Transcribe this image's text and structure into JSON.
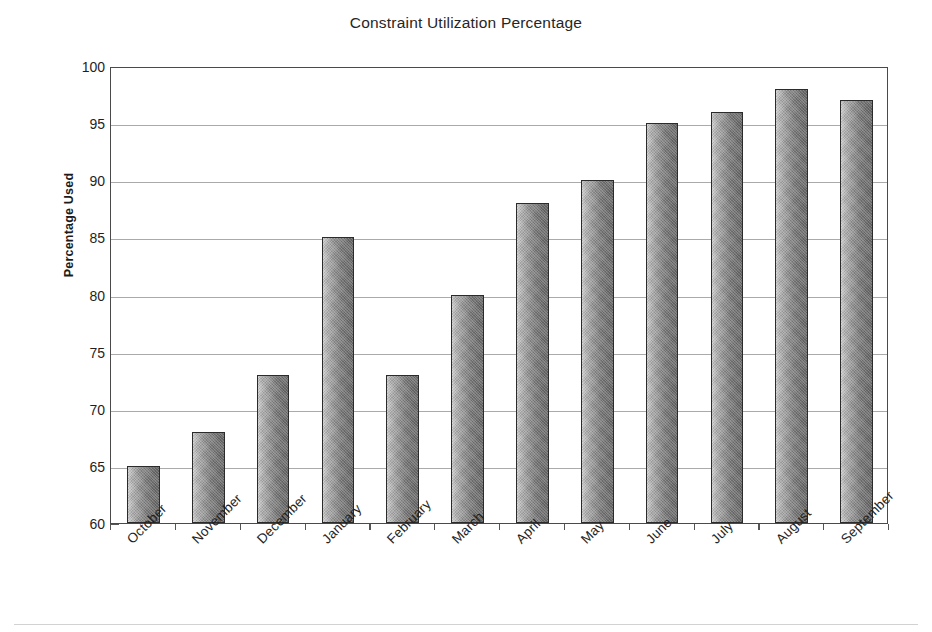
{
  "chart_data": {
    "type": "bar",
    "title": "Constraint Utilization Percentage",
    "xlabel": "",
    "ylabel": "Percentage Used",
    "categories": [
      "October",
      "November",
      "December",
      "January",
      "February",
      "March",
      "April",
      "May",
      "June",
      "July",
      "August",
      "September"
    ],
    "values": [
      65,
      68,
      73,
      85,
      73,
      80,
      88,
      90,
      95,
      96,
      98,
      97
    ],
    "ylim": [
      60,
      100
    ],
    "ytick_labels": [
      "100",
      "95",
      "90",
      "85",
      "80",
      "75",
      "70",
      "65",
      "60"
    ],
    "ytick_values": [
      100,
      95,
      90,
      85,
      80,
      75,
      70,
      65,
      60
    ],
    "ytick_step": 5,
    "grid": true,
    "legend": null,
    "bar_fill": "#8a8a8a",
    "bar_edge": "#2b2b2b",
    "grid_color": "#8d8d8d",
    "axis_color": "#4a4a4a",
    "background": "#ffffff",
    "xtick_label_rotation": -45
  }
}
